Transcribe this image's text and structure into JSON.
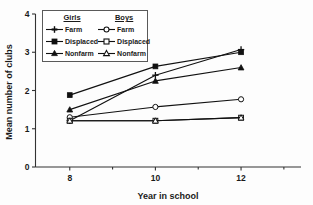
{
  "chart_data": {
    "type": "line",
    "title": "",
    "xlabel": "Year in school",
    "ylabel": "Mean number of clubs",
    "x": [
      8,
      10,
      12
    ],
    "xtick_labels": [
      "8",
      "10",
      "12"
    ],
    "ytick_labels": [
      "0",
      "1",
      "2",
      "3",
      "4"
    ],
    "xlim": [
      7.2,
      13.4
    ],
    "ylim": [
      0,
      4
    ],
    "grid": false,
    "legend_position": "upper-left-inside",
    "legend_headers": [
      "Girls",
      "Boys"
    ],
    "series": [
      {
        "name": "Girls Farm",
        "group": "Girls",
        "category": "Farm",
        "marker": "cross-filled",
        "values": [
          1.21,
          2.4,
          3.07
        ]
      },
      {
        "name": "Girls Displaced",
        "group": "Girls",
        "category": "Displaced",
        "marker": "square-filled",
        "values": [
          1.88,
          2.63,
          3.0
        ]
      },
      {
        "name": "Girls Nonfarm",
        "group": "Girls",
        "category": "Nonfarm",
        "marker": "triangle-filled",
        "values": [
          1.5,
          2.25,
          2.6
        ]
      },
      {
        "name": "Boys Farm",
        "group": "Boys",
        "category": "Farm",
        "marker": "circle-open",
        "values": [
          1.3,
          1.57,
          1.77
        ]
      },
      {
        "name": "Boys Displaced",
        "group": "Boys",
        "category": "Displaced",
        "marker": "square-open",
        "values": [
          1.21,
          1.21,
          1.29
        ]
      },
      {
        "name": "Boys Nonfarm",
        "group": "Boys",
        "category": "Nonfarm",
        "marker": "triangle-open",
        "values": [
          1.21,
          1.21,
          1.29
        ]
      }
    ]
  },
  "legend": {
    "girls_header": "Girls",
    "boys_header": "Boys",
    "girls_items": [
      {
        "label": "Farm"
      },
      {
        "label": "Displaced"
      },
      {
        "label": "Nonfarm"
      }
    ],
    "boys_items": [
      {
        "label": "Farm"
      },
      {
        "label": "Displaced"
      },
      {
        "label": "Nonfarm"
      }
    ]
  },
  "axes": {
    "x_title": "Year in school",
    "y_title": "Mean number of clubs",
    "x_ticks": [
      "8",
      "10",
      "12"
    ],
    "y_ticks": [
      "0",
      "1",
      "2",
      "3",
      "4"
    ]
  },
  "colors": {
    "line": "#111111",
    "axis": "#333333",
    "background": "#fdfdfd",
    "legend_border": "#5a5a5a"
  }
}
